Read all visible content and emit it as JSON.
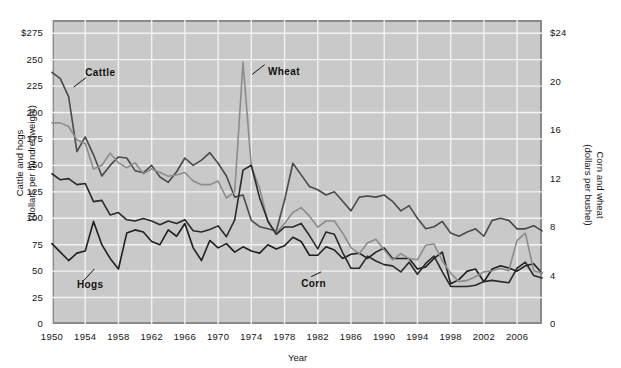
{
  "chart_data": {
    "type": "line",
    "title": "",
    "xlabel": "Year",
    "ylabel_left": "Cattle and hogs\n(dollars per hundredweight)",
    "ylabel_right": "Corn and wheat\n(dollars per bushel)",
    "grid": true,
    "legend_position": "inline-annotations",
    "xlim": [
      1950,
      2009
    ],
    "x_ticks": [
      "1950",
      "1954",
      "1958",
      "1962",
      "1966",
      "1970",
      "1974",
      "1978",
      "1982",
      "1986",
      "1990",
      "1994",
      "1998",
      "2002",
      "2006"
    ],
    "x_tick_values": [
      1950,
      1954,
      1958,
      1962,
      1966,
      1970,
      1974,
      1978,
      1982,
      1986,
      1990,
      1994,
      1998,
      2002,
      2006
    ],
    "ylim_left": [
      0,
      287.5
    ],
    "y_ticks_left": [
      "$275",
      "250",
      "225",
      "200",
      "175",
      "150",
      "125",
      "100",
      "75",
      "50",
      "25",
      "0"
    ],
    "y_tick_values_left": [
      275,
      250,
      225,
      200,
      175,
      150,
      125,
      100,
      75,
      50,
      25,
      0
    ],
    "ylim_right": [
      0,
      25.09
    ],
    "y_ticks_right": [
      "$24",
      "20",
      "16",
      "12",
      "8",
      "4",
      "0"
    ],
    "y_tick_values_right": [
      24,
      20,
      16,
      12,
      8,
      4,
      0
    ],
    "x": [
      1950,
      1951,
      1952,
      1953,
      1954,
      1955,
      1956,
      1957,
      1958,
      1959,
      1960,
      1961,
      1962,
      1963,
      1964,
      1965,
      1966,
      1967,
      1968,
      1969,
      1970,
      1971,
      1972,
      1973,
      1974,
      1975,
      1976,
      1977,
      1978,
      1979,
      1980,
      1981,
      1982,
      1983,
      1984,
      1985,
      1986,
      1987,
      1988,
      1989,
      1990,
      1991,
      1992,
      1993,
      1994,
      1995,
      1996,
      1997,
      1998,
      1999,
      2000,
      2001,
      2002,
      2003,
      2004,
      2005,
      2006,
      2007,
      2008,
      2009
    ],
    "series": [
      {
        "name": "Cattle",
        "axis": "left",
        "units": "dollars per hundredweight",
        "color": "#4a4a4a",
        "values": [
          238,
          232,
          215,
          163,
          177,
          160,
          140,
          150,
          158,
          157,
          145,
          143,
          150,
          139,
          134,
          144,
          157,
          150,
          155,
          162,
          152,
          140,
          120,
          122,
          98,
          92,
          90,
          88,
          117,
          152,
          141,
          130,
          127,
          122,
          125,
          116,
          107,
          120,
          121,
          120,
          122,
          116,
          107,
          112,
          100,
          90,
          92,
          97,
          86,
          83,
          87,
          90,
          83,
          98,
          100,
          98,
          90,
          90,
          93,
          88
        ]
      },
      {
        "name": "Hogs",
        "axis": "left",
        "units": "dollars per hundredweight",
        "color": "#1f1f1f",
        "values": [
          76,
          68,
          60,
          67,
          69,
          97,
          75,
          62,
          52,
          86,
          89,
          87,
          78,
          75,
          89,
          83,
          95,
          72,
          60,
          79,
          72,
          76,
          68,
          73,
          69,
          67,
          75,
          71,
          74,
          82,
          78,
          65,
          65,
          73,
          70,
          62,
          66,
          67,
          62,
          68,
          72,
          62,
          62,
          62,
          52,
          54,
          62,
          68,
          38,
          42,
          50,
          52,
          40,
          52,
          55,
          53,
          50,
          55,
          57,
          48
        ]
      },
      {
        "name": "Wheat",
        "axis": "right",
        "units": "dollars per bushel",
        "color": "#8c8c8c",
        "values": [
          16.6,
          16.6,
          16.3,
          15.2,
          14.9,
          12.8,
          13.1,
          14.1,
          13.3,
          12.9,
          13.3,
          12.4,
          12.8,
          12.5,
          12.2,
          12.3,
          12.5,
          11.8,
          11.5,
          11.5,
          11.8,
          10.4,
          10.9,
          21.6,
          13.0,
          11.2,
          8.4,
          7.5,
          8.3,
          9.2,
          9.6,
          8.9,
          8.0,
          8.5,
          8.5,
          7.5,
          6.3,
          5.8,
          6.7,
          7.0,
          6.1,
          5.3,
          5.8,
          5.4,
          5.3,
          6.5,
          6.6,
          5.2,
          4.2,
          3.5,
          3.6,
          3.9,
          4.3,
          4.4,
          4.6,
          4.4,
          6.9,
          7.5,
          4.4,
          4.2
        ]
      },
      {
        "name": "Corn",
        "axis": "right",
        "units": "dollars per bushel",
        "color": "#2a2a2a",
        "values": [
          12.4,
          11.9,
          12.0,
          11.5,
          11.6,
          10.1,
          10.2,
          9.0,
          9.2,
          8.6,
          8.5,
          8.7,
          8.5,
          8.2,
          8.5,
          8.3,
          8.6,
          7.7,
          7.6,
          7.8,
          8.1,
          7.2,
          8.6,
          12.7,
          13.1,
          10.4,
          8.5,
          7.4,
          8.0,
          8.0,
          8.3,
          7.3,
          6.2,
          7.6,
          7.4,
          5.9,
          4.6,
          4.6,
          5.6,
          5.2,
          4.9,
          4.8,
          4.3,
          5.1,
          4.1,
          5.0,
          5.6,
          4.3,
          3.1,
          3.1,
          3.1,
          3.2,
          3.5,
          3.6,
          3.5,
          3.4,
          4.6,
          5.1,
          4.0,
          3.8
        ]
      }
    ],
    "annotations": [
      {
        "label": "Cattle",
        "x": 1954,
        "y": 237
      },
      {
        "label": "Wheat",
        "x": 1976,
        "y": 238
      },
      {
        "label": "Hogs",
        "x": 1953,
        "y": 37
      },
      {
        "label": "Corn",
        "x": 1980,
        "y": 38
      }
    ]
  }
}
